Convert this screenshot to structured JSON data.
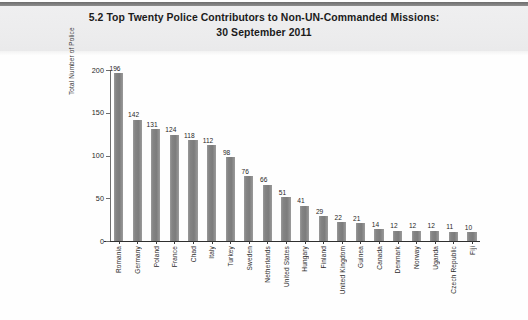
{
  "header": {
    "number": "5.2",
    "title_line1": "5.2  Top Twenty Police Contributors to Non-UN-Commanded Missions:",
    "title_line2": "30 September 2011"
  },
  "chart_data": {
    "type": "bar",
    "title": "5.2  Top Twenty Police Contributors to Non-UN-Commanded Missions: 30 September 2011",
    "xlabel": "",
    "ylabel": "Total Number of Police",
    "ylim": [
      0,
      200
    ],
    "yticks": [
      "0",
      "50",
      "100",
      "150",
      "200"
    ],
    "grid": false,
    "legend": "none",
    "bar_color": "#858585",
    "categories": [
      "Romania",
      "Germany",
      "Poland",
      "France",
      "Chad",
      "Italy",
      "Turkey",
      "Sweden",
      "Netherlands",
      "United States",
      "Hungary",
      "Finland",
      "United Kingdom",
      "Guinea",
      "Canada",
      "Denmark",
      "Norway",
      "Uganda",
      "Czech Republic",
      "Fiji"
    ],
    "values": [
      196,
      142,
      131,
      124,
      118,
      112,
      98,
      76,
      66,
      51,
      41,
      29,
      22,
      21,
      14,
      12,
      12,
      12,
      11,
      10
    ]
  }
}
